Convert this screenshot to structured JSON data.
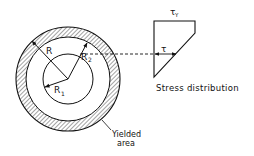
{
  "diagram": {
    "labels": {
      "outer_radius": "R",
      "inner_radius": "R",
      "inner_radius_sub": "1",
      "yield_radius": "R",
      "yield_radius_sub": "2",
      "yield_stress": "τ",
      "yield_stress_sub": "Y",
      "stress": "τ",
      "yielded_line1": "Yielded",
      "yielded_line2": "area",
      "stress_caption": "Stress distribution"
    },
    "colors": {
      "stroke": "#111111",
      "hatch": "#333333",
      "background": "#ffffff"
    }
  }
}
